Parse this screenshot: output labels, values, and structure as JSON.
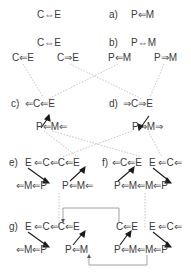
{
  "colors": {
    "text": "#3a3a3a",
    "dotted": "#b5b5b5",
    "arrow": "#1a1a1a",
    "connector": "#8a8a8a"
  },
  "panel_a": {
    "left": "C⇔E",
    "marker": "a)",
    "right": "P⇐M"
  },
  "panel_b": {
    "top_left": "C⇔E",
    "marker": "b)",
    "top_right": "P⇔M",
    "split": [
      "C⇐E",
      "C⇒E",
      "P⇐M",
      "P⇒M"
    ]
  },
  "panel_c": {
    "marker": "c)",
    "top": "⇐C⇐E",
    "bottom": "P⇐M⇐"
  },
  "panel_d": {
    "marker": "d)",
    "top": "⇒C⇒E",
    "bottom": "P⇒M⇒"
  },
  "panel_e": {
    "marker": "e)",
    "top": "E ⇐C⇐C⇐E",
    "bottom_left": "⇐M⇐P",
    "bottom_right": "P⇐M⇐"
  },
  "panel_f": {
    "marker": "f)",
    "top_left": "⇐C⇐E",
    "top_right": "E ⇐C⇐",
    "bottom": "P⇐M⇐M⇐P"
  },
  "panel_g": {
    "marker": "g)",
    "top_left": "E ⇐C⇐C⇐E",
    "top_mid": "C⇐E",
    "top_right": "E ⇐C⇐",
    "bottom_left": "⇐M⇐P",
    "bottom_mid": "P⇐M",
    "bottom_right": "P⇐M⇐M⇐P"
  }
}
